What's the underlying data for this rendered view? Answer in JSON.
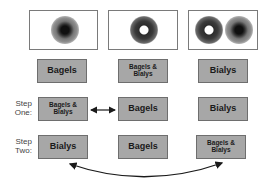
{
  "images": [
    {
      "id": "bagels",
      "content": "one bialy-like ring (dark center)"
    },
    {
      "id": "bagels-bialys",
      "content": "one bagel (hole)"
    },
    {
      "id": "bialys",
      "content": "bagel and bialy"
    }
  ],
  "category_labels": [
    "Bagels",
    "Bagels &\nBialys",
    "Bialys"
  ],
  "steps": [
    {
      "label": "Step\nOne:",
      "cells": [
        "Bagels &\nBialys",
        "Bagels",
        "Bialys"
      ]
    },
    {
      "label": "Step\nTwo:",
      "cells": [
        "Bialys",
        "Bagels",
        "Bagels &\nBialys"
      ]
    }
  ],
  "arrows": [
    {
      "type": "double-straight",
      "from": "step-one-col1",
      "to": "step-one-col2"
    },
    {
      "type": "double-curved",
      "from": "step-two-col1",
      "to": "step-two-col3"
    }
  ],
  "colors": {
    "box_fill": "#a7a7a7",
    "box_border": "#6e6e6e",
    "arrow": "#1a1a1a",
    "text": "#1a1a1a"
  }
}
